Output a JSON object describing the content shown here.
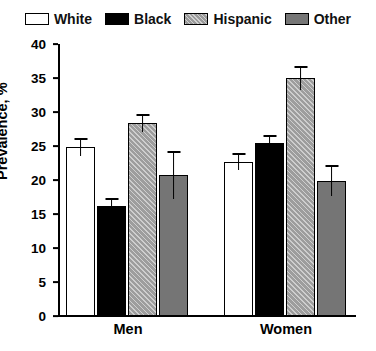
{
  "chart_data": {
    "type": "bar",
    "title": "",
    "xlabel": "",
    "ylabel": "Prevalence, %",
    "ylim": [
      0,
      40
    ],
    "yticks": [
      0,
      5,
      10,
      15,
      20,
      25,
      30,
      35,
      40
    ],
    "grid": false,
    "legend_position": "top-center",
    "categories": [
      "Men",
      "Women"
    ],
    "series": [
      {
        "name": "White",
        "fill": "open",
        "color": "#ffffff",
        "values": [
          24.9,
          22.7
        ],
        "errors": [
          1.3,
          1.2
        ]
      },
      {
        "name": "Black",
        "fill": "solid-black",
        "color": "#000000",
        "values": [
          16.2,
          25.5
        ],
        "errors": [
          1.2,
          1.1
        ]
      },
      {
        "name": "Hispanic",
        "fill": "hatched-gray",
        "color": "#9d9d9d",
        "values": [
          28.4,
          35.0
        ],
        "errors": [
          1.3,
          1.7
        ]
      },
      {
        "name": "Other",
        "fill": "solid-gray",
        "color": "#757575",
        "values": [
          20.7,
          19.9
        ],
        "errors": [
          3.5,
          2.3
        ]
      }
    ]
  },
  "legend": {
    "items": [
      {
        "label": "White",
        "swatch": "swatch-white"
      },
      {
        "label": "Black",
        "swatch": "swatch-black"
      },
      {
        "label": "Hispanic",
        "swatch": "swatch-hispanic"
      },
      {
        "label": "Other",
        "swatch": "swatch-other"
      }
    ]
  },
  "axis": {
    "y_title": "Prevalence, %",
    "y_tick_labels": [
      "40",
      "35",
      "30",
      "25",
      "20",
      "15",
      "10",
      "5",
      "0"
    ],
    "x_group_labels": [
      "Men",
      "Women"
    ]
  }
}
